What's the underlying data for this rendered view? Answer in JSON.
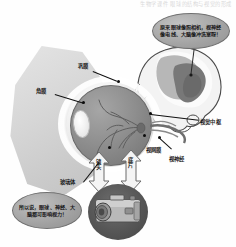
{
  "page": {
    "header_text": "生物学课件 眼球的结构与视觉的形成",
    "background_color": "#ffffff"
  },
  "bubbles": [
    {
      "id": "brain-bubble",
      "name": "visual-cortex-callout",
      "text": "原来眼球像照相机，视神经像电线、大脑像冲洗室呀！",
      "fill_color": "#a8a8a8",
      "text_color": "#151515"
    },
    {
      "id": "vision-bubble",
      "name": "vision-warning-callout",
      "text": "所以说，眼球、神经、大脑都可影响视力！",
      "fill_color": "#a8a8a8",
      "text_color": "#151515"
    }
  ],
  "labels": [
    {
      "id": "sclera",
      "name": "label-sclera",
      "text": "巩膜",
      "x": 78,
      "y": 63
    },
    {
      "id": "cornea",
      "name": "label-cornea",
      "text": "角膜",
      "x": 36,
      "y": 88
    },
    {
      "id": "cortex",
      "name": "label-visual-cortex",
      "text": "视觉中枢",
      "x": 200,
      "y": 119
    },
    {
      "id": "nerve",
      "name": "label-optic-nerve",
      "text": "视神经",
      "x": 169,
      "y": 156
    },
    {
      "id": "vitreous",
      "name": "label-vitreous-body",
      "text": "玻璃体",
      "x": 60,
      "y": 179
    },
    {
      "id": "retina",
      "name": "label-retina",
      "text": "视网膜",
      "x": 146,
      "y": 147
    }
  ],
  "arrow_labels": [
    {
      "id": "lens-arrow",
      "name": "label-camera-lens",
      "text": "镜头",
      "x": 95,
      "y": 159
    },
    {
      "id": "film-arrow",
      "name": "label-camera-film",
      "text": "底片",
      "x": 127,
      "y": 157
    }
  ],
  "diagram_parts": {
    "eyeball": {
      "name": "eyeball-diagram",
      "sclera_color": "#f0f0f0",
      "globe_color": "#8f8f8f",
      "lens_color": "#f4f4f4"
    },
    "head": {
      "name": "head-brain-diagram",
      "skin_color": "#efefef",
      "brain_color": "#9a9a9a",
      "cortex_color": "#6f6f6f"
    },
    "camera": {
      "name": "camera-illustration",
      "disc_color": "#565656",
      "body_color": "#b4b4b4"
    }
  },
  "colors": {
    "ink": "#1b1b1b",
    "leader_line": "#111111",
    "arrow_fill": "#f2f2f2",
    "arrow_stroke": "#6b6b6b"
  }
}
